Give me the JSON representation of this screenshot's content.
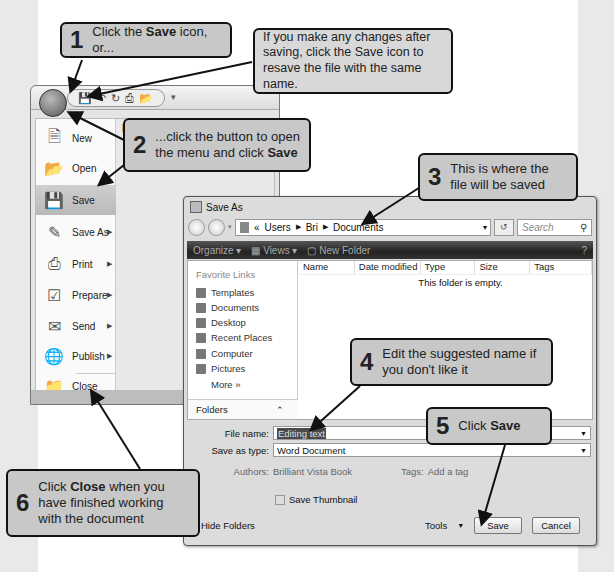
{
  "page": {
    "top_text_cut": "...you can save your work to the disk at any time by clicking the Save icon, though ..."
  },
  "word": {
    "qat_icons": [
      "save-icon",
      "undo-icon",
      "redo-icon",
      "print-icon",
      "open-icon"
    ],
    "menu": {
      "recent_label": "Recent Documents",
      "items": [
        {
          "label": "New",
          "icon": "new-doc-icon",
          "submenu": false
        },
        {
          "label": "Open",
          "icon": "open-folder-icon",
          "submenu": false
        },
        {
          "label": "Save",
          "icon": "save-disk-icon",
          "submenu": false,
          "selected": true
        },
        {
          "label": "Save As",
          "icon": "save-as-icon",
          "submenu": true
        },
        {
          "label": "Print",
          "icon": "printer-icon",
          "submenu": true
        },
        {
          "label": "Prepare",
          "icon": "prepare-icon",
          "submenu": true
        },
        {
          "label": "Send",
          "icon": "send-icon",
          "submenu": true
        },
        {
          "label": "Publish",
          "icon": "publish-icon",
          "submenu": true
        },
        {
          "label": "Close",
          "icon": "close-folder-icon",
          "submenu": false
        }
      ]
    }
  },
  "dialog": {
    "title": "Save As",
    "breadcrumb": {
      "prefix": "«",
      "parts": [
        "Users",
        "Bri",
        "Documents"
      ]
    },
    "search_placeholder": "Search",
    "toolbar": {
      "organize": "Organize",
      "views": "Views",
      "new_folder": "New Folder",
      "help": "?"
    },
    "favorite_links_title": "Favorite Links",
    "favorite_links": [
      "Templates",
      "Documents",
      "Desktop",
      "Recent Places",
      "Computer",
      "Pictures"
    ],
    "more_label": "More »",
    "folders_label": "Folders",
    "columns": [
      "Name",
      "Date modified",
      "Type",
      "Size",
      "Tags"
    ],
    "empty_message": "This folder is empty.",
    "file_name_label": "File name:",
    "file_name_value": "Editing text",
    "save_type_label": "Save as type:",
    "save_type_value": "Word Document",
    "authors_label": "Authors:",
    "authors_value": "Brilliant Vista Book",
    "tags_label": "Tags:",
    "tags_value": "Add a tag",
    "save_thumbnail_label": "Save Thumbnail",
    "hide_folders_label": "Hide Folders",
    "tools_label": "Tools",
    "save_button": "Save",
    "cancel_button": "Cancel"
  },
  "callouts": {
    "c1": {
      "num": "1",
      "pre": "Click the ",
      "bold": "Save",
      "post": " icon, or..."
    },
    "tip": {
      "text": "If you make any changes after saving, click the Save icon to resave the file with the same name."
    },
    "c2": {
      "num": "2",
      "pre": "...click the button to open the menu and click ",
      "bold": "Save"
    },
    "c3": {
      "num": "3",
      "text": "This is where the file will be saved"
    },
    "c4": {
      "num": "4",
      "text": "Edit the suggested name if you don't like it"
    },
    "c5": {
      "num": "5",
      "pre": "Click ",
      "bold": "Save"
    },
    "c6": {
      "num": "6",
      "pre": "Click ",
      "bold": "Close",
      "post": " when you have finished working with the document"
    }
  }
}
